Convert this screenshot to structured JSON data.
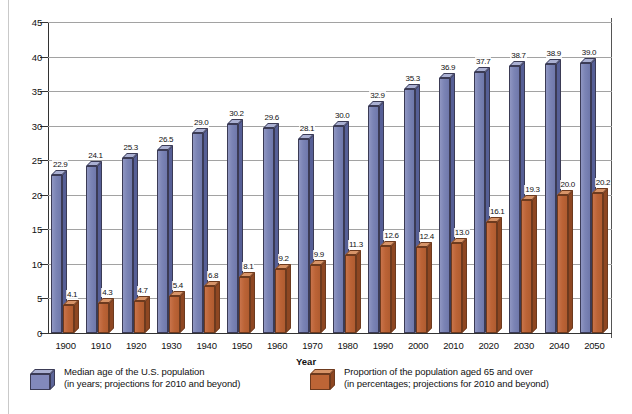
{
  "chart_data": {
    "type": "bar",
    "title": "",
    "xlabel": "Year",
    "ylabel": "",
    "ylim": [
      0,
      45
    ],
    "yticks": [
      0,
      5,
      10,
      15,
      20,
      25,
      30,
      35,
      40,
      45
    ],
    "grid": true,
    "legend_position": "bottom",
    "categories": [
      "1900",
      "1910",
      "1920",
      "1930",
      "1940",
      "1950",
      "1960",
      "1970",
      "1980",
      "1990",
      "2000",
      "2010",
      "2020",
      "2030",
      "2040",
      "2050"
    ],
    "series": [
      {
        "name": "Median age of the U.S. population",
        "color": "#7b84b5",
        "values": [
          22.9,
          24.1,
          25.3,
          26.5,
          29.0,
          30.2,
          29.6,
          28.1,
          30.0,
          32.9,
          35.3,
          36.9,
          37.7,
          38.7,
          38.9,
          39.0
        ],
        "value_labels": [
          "22.9",
          "24.1",
          "25.3",
          "26.5",
          "29.0",
          "30.2",
          "29.6",
          "28.1",
          "30.0",
          "32.9",
          "35.3",
          "36.9",
          "37.7",
          "38.7",
          "38.9",
          "39.0"
        ]
      },
      {
        "name": "Proportion of the population aged 65 and over",
        "color": "#bb6336",
        "values": [
          4.1,
          4.3,
          4.7,
          5.4,
          6.8,
          8.1,
          9.2,
          9.9,
          11.3,
          12.6,
          12.4,
          13.0,
          16.1,
          19.3,
          20.0,
          20.2
        ],
        "value_labels": [
          "4.1",
          "4.3",
          "4.7",
          "5.4",
          "6.8",
          "8.1",
          "9.2",
          "9.9",
          "11.3",
          "12.6",
          "12.4",
          "13.0",
          "16.1",
          "19.3",
          "20.0",
          "20.2"
        ]
      }
    ]
  },
  "axis": {
    "x_title": "Year"
  },
  "legend": {
    "items": [
      {
        "line1": "Median age of the U.S. population",
        "line2": "(in years; projections for 2010 and beyond)",
        "swatch": "blue-cube-icon"
      },
      {
        "line1": "Proportion of the population aged 65 and over",
        "line2": "(in percentages; projections for 2010 and beyond)",
        "swatch": "orange-cube-icon"
      }
    ]
  }
}
